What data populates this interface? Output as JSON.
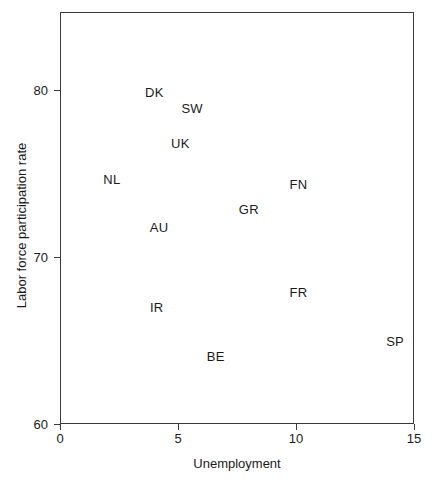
{
  "chart_data": {
    "type": "scatter",
    "title": "",
    "xlabel": "Unemployment",
    "ylabel": "Labor force participation rate",
    "xlim": [
      0,
      15
    ],
    "ylim": [
      60,
      82
    ],
    "xticks": [
      "0",
      "5",
      "10",
      "15"
    ],
    "xtick_values": [
      0,
      5,
      10,
      15
    ],
    "yticks": [
      "60",
      "70",
      "80"
    ],
    "ytick_values": [
      60,
      70,
      80
    ],
    "grid": false,
    "legend": "none",
    "marker_style": "text-label-only",
    "points": [
      {
        "label": "DK",
        "x": 4.0,
        "y": 79.9
      },
      {
        "label": "SW",
        "x": 5.6,
        "y": 78.9
      },
      {
        "label": "UK",
        "x": 5.1,
        "y": 76.8
      },
      {
        "label": "NL",
        "x": 2.2,
        "y": 74.7
      },
      {
        "label": "FN",
        "x": 10.1,
        "y": 74.4
      },
      {
        "label": "GR",
        "x": 8.0,
        "y": 72.9
      },
      {
        "label": "AU",
        "x": 4.2,
        "y": 71.8
      },
      {
        "label": "FR",
        "x": 10.1,
        "y": 67.9
      },
      {
        "label": "IR",
        "x": 4.1,
        "y": 67.0
      },
      {
        "label": "SP",
        "x": 14.2,
        "y": 65.0
      },
      {
        "label": "BE",
        "x": 6.6,
        "y": 64.1
      }
    ]
  },
  "colors": {
    "axis": "#3a3a3a",
    "text": "#1a1a1a",
    "background": "#ffffff"
  }
}
